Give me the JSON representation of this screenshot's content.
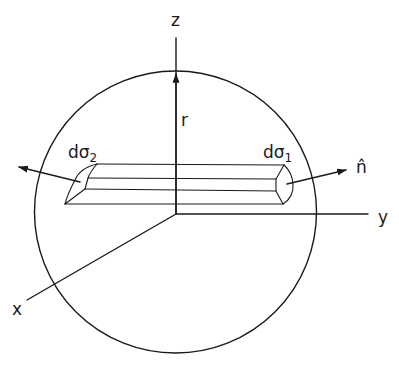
{
  "figure": {
    "type": "3D coordinate diagram",
    "colors": {
      "ink": "#1a1a1a",
      "background": "#ffffff"
    }
  },
  "axes": {
    "z": {
      "label": "z"
    },
    "y": {
      "label": "y"
    },
    "x": {
      "label": "x"
    }
  },
  "labels": {
    "radius": "r",
    "surface_2": {
      "base": "dσ",
      "subscript": "2"
    },
    "surface_1": {
      "base": "dσ",
      "subscript": "1"
    },
    "normal": "n̂"
  },
  "elements": {
    "sphere": {
      "name": "sphere-outline"
    },
    "slab": {
      "name": "cylindrical-slab"
    },
    "normal_arrow_right": {
      "name": "normal-arrow-1"
    },
    "normal_arrow_left": {
      "name": "normal-arrow-2"
    }
  }
}
